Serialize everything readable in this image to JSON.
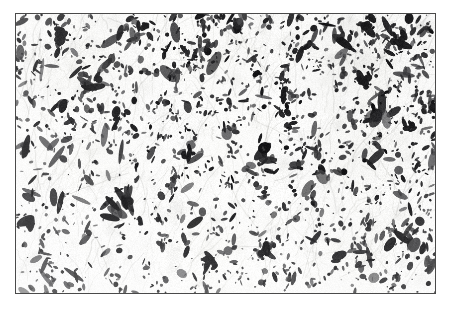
{
  "figure": {
    "type": "natural-image",
    "caption": "",
    "title": "",
    "label": ""
  },
  "frame": {
    "border_color": "#4a4a4a",
    "border_width_px": 1,
    "margin_color": "#ffffff",
    "left_px": 15,
    "top_px": 13,
    "width_px": 421,
    "height_px": 281
  },
  "image": {
    "stain": "hematoxylin-eosin",
    "background_color": "#fbfbfa",
    "fiber_color": "#b9b9b6",
    "nucleus_color": "#1a1a1a",
    "nucleus_color_light": "#565656",
    "description": "Pale fibrillary spindle-cell tissue with densely scattered dark elongated hyperchromatic nuclei streaming in wavy vertical fascicles; upper and right portions more cellular, lower-left paler.",
    "texture": {
      "fiber_strand_count": 520,
      "nucleus_count_dense": 1450,
      "nucleus_count_sparse": 520,
      "density_gradient": "top-right dense to bottom-left sparse",
      "fascicle_orientation_deg": -78,
      "seed": 20240517
    },
    "regions": [
      {
        "name": "upper-left",
        "density": 0.82,
        "tone": "#f7f7f5"
      },
      {
        "name": "upper-center",
        "density": 0.74,
        "tone": "#fafaf8"
      },
      {
        "name": "upper-right",
        "density": 1.0,
        "tone": "#f2f2f0"
      },
      {
        "name": "mid-left",
        "density": 0.7,
        "tone": "#fafaf8"
      },
      {
        "name": "mid-center",
        "density": 0.66,
        "tone": "#fcfcfa"
      },
      {
        "name": "mid-right",
        "density": 0.88,
        "tone": "#f6f6f4"
      },
      {
        "name": "lower-left",
        "density": 0.55,
        "tone": "#fdfdfc"
      },
      {
        "name": "lower-center",
        "density": 0.58,
        "tone": "#fdfdfb"
      },
      {
        "name": "lower-right",
        "density": 0.72,
        "tone": "#f9f9f7"
      }
    ]
  }
}
